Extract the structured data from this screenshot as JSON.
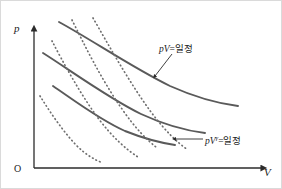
{
  "figure": {
    "axes": {
      "y_label": "p",
      "x_label": "V",
      "origin_label": "O"
    },
    "annotations": {
      "isotherm_label_prefix": "p",
      "isotherm_label_var": "V",
      "isotherm_label_suffix": "=일정",
      "adiabat_label_prefix": "p",
      "adiabat_label_var": "V",
      "adiabat_label_exponent": "γ",
      "adiabat_label_suffix": "=일정"
    },
    "colors": {
      "solid_curve": "#5a5a5a",
      "dotted_curve": "#6e6e6e",
      "axis": "#2b2b2b",
      "border": "#d8d8d8",
      "background": "#ffffff",
      "text": "#1a1a1a"
    }
  },
  "chart_data": {
    "type": "line",
    "title": "",
    "xlabel": "V",
    "ylabel": "p",
    "xlim": [
      0,
      1
    ],
    "ylim": [
      0,
      1
    ],
    "grid": false,
    "legend": "none",
    "annotations": [
      {
        "text": "pV=일정",
        "points_to": "solid-isotherm-top",
        "arrow": "down-left"
      },
      {
        "text": "pV^γ=일정",
        "points_to": "dotted-adiabat-right",
        "arrow": "left"
      }
    ],
    "series": [
      {
        "name": "isotherm-1",
        "style": "solid",
        "label": "pV=일정",
        "path": "M 53,86 C 75,101 100,120 125,131 C 145,139 162,143 175,145"
      },
      {
        "name": "isotherm-2",
        "style": "solid",
        "label": "pV=일정",
        "path": "M 43,53 C 70,70 108,98 141,114 C 167,126 189,131 205,133"
      },
      {
        "name": "isotherm-3",
        "style": "solid",
        "label": "pV=일정",
        "path": "M 59,22 C 92,40 133,68 170,86 C 199,99 222,104 238,106"
      },
      {
        "name": "adiabat-1",
        "style": "dotted",
        "label": "pV^γ=일정",
        "path": "M 40,96 C 50,112 62,130 76,145 C 86,155 95,160 103,163"
      },
      {
        "name": "adiabat-2",
        "style": "dotted",
        "label": "pV^γ=일정",
        "path": "M 52,41 C 63,62 79,92 98,118 C 113,138 127,150 138,157"
      },
      {
        "name": "adiabat-3",
        "style": "dotted",
        "label": "pV^γ=일정",
        "path": "M 72,20 C 84,44 101,79 122,109 C 135,128 147,140 156,147"
      },
      {
        "name": "adiabat-4",
        "style": "dotted",
        "label": "pV^γ=일정",
        "path": "M 93,18 C 108,44 129,82 151,112 C 166,132 178,143 188,150"
      }
    ]
  }
}
